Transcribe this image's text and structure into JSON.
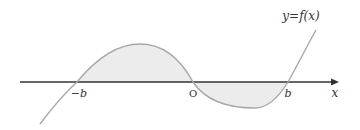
{
  "diagram": {
    "type": "function-graph",
    "curve_label": "y=f(x)",
    "axis_label": "x",
    "tick_labels": {
      "neg_b": "−b",
      "origin": "O",
      "pos_b": "b"
    },
    "regions": [
      {
        "name": "shaded-area-above",
        "from": "−b",
        "to": "O",
        "side": "above x-axis"
      },
      {
        "name": "shaded-area-below",
        "from": "O",
        "to": "b",
        "side": "below x-axis"
      }
    ],
    "colors": {
      "axis": "#333333",
      "curve": "#a8a8a8",
      "fill": "#ececec",
      "text": "#333333",
      "background": "#ffffff"
    }
  }
}
